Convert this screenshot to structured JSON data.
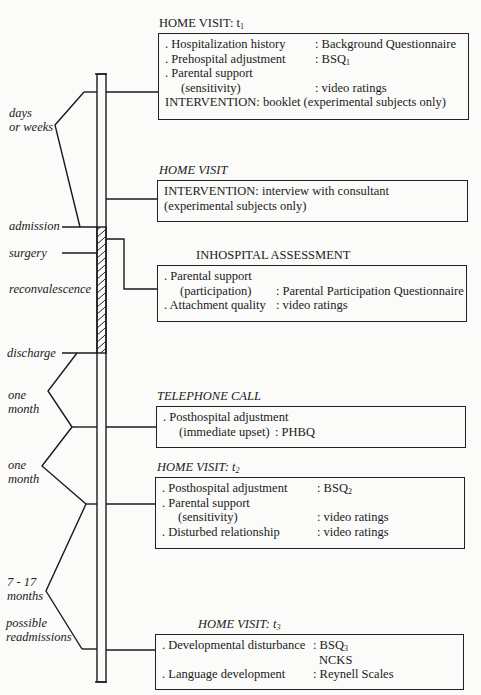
{
  "timeline_labels": {
    "days_or_weeks": [
      "days",
      "or weeks"
    ],
    "admission": "admission",
    "surgery": "surgery",
    "reconvalescence": "reconvalescence",
    "discharge": "discharge",
    "one_month_1": [
      "one",
      "month"
    ],
    "one_month_2": [
      "one",
      "month"
    ],
    "months_7_17": [
      "7 - 17",
      "months"
    ],
    "possible_readmissions": [
      "possible",
      "readmissions"
    ]
  },
  "events": [
    {
      "title": "HOME VISIT: t",
      "title_sub": "1",
      "rows": [
        {
          "k": ". Hospitalization history",
          "v": ": Background Questionnaire"
        },
        {
          "k": ". Prehospital adjustment",
          "v": ": BSQ",
          "v_sub": "1"
        },
        {
          "k": ". Parental support",
          "v": ""
        },
        {
          "k": "(sensitivity)",
          "v": ": video ratings",
          "indent": true
        },
        {
          "k": "INTERVENTION: booklet (experimental subjects only)",
          "v": ""
        }
      ]
    },
    {
      "title": "HOME VISIT",
      "rows": [
        {
          "k": "INTERVENTION: interview with consultant",
          "v": ""
        },
        {
          "k": "(experimental subjects only)",
          "v": ""
        }
      ]
    },
    {
      "title": "INHOSPITAL ASSESSMENT",
      "rows": [
        {
          "k": ". Parental support",
          "v": ""
        },
        {
          "k": "(participation)",
          "v": ": Parental Participation Questionnaire",
          "indent": true
        },
        {
          "k": ". Attachment quality",
          "v": ": video ratings"
        }
      ]
    },
    {
      "title": "TELEPHONE CALL",
      "rows": [
        {
          "k": ". Posthospital adjustment",
          "v": ""
        },
        {
          "k": "(immediate upset)",
          "v": ": PHBQ",
          "indent": true
        }
      ]
    },
    {
      "title": "HOME VISIT: t",
      "title_sub": "2",
      "rows": [
        {
          "k": ". Posthospital adjustment",
          "v": ": BSQ",
          "v_sub": "2"
        },
        {
          "k": ". Parental support",
          "v": ""
        },
        {
          "k": "(sensitivity)",
          "v": ": video ratings",
          "indent": true
        },
        {
          "k": ". Disturbed relationship",
          "v": ": video ratings"
        }
      ]
    },
    {
      "title": "HOME VISIT: t",
      "title_sub": "3",
      "rows": [
        {
          "k": ". Developmental disturbance",
          "v": ": BSQ",
          "v_sub": "3"
        },
        {
          "k": "",
          "v": "NCKS"
        },
        {
          "k": ". Language development",
          "v": ": Reynell Scales"
        }
      ]
    }
  ]
}
